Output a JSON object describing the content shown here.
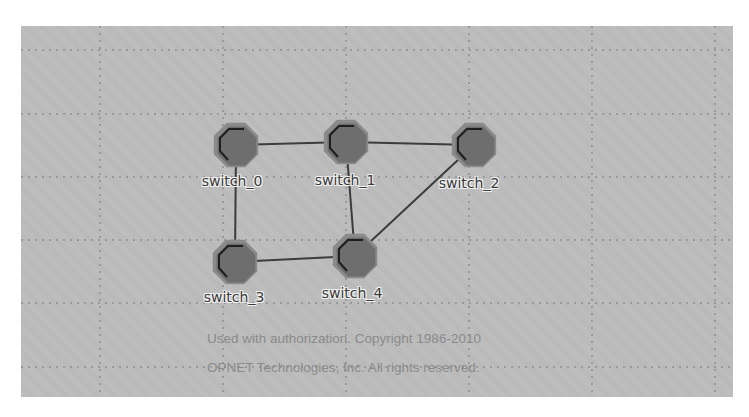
{
  "canvas": {
    "background": "#bdbdbd",
    "grid_color": "#8e8e8e",
    "grid_x": [
      100,
      223,
      346,
      469,
      592,
      715
    ],
    "grid_y": [
      50,
      114,
      177,
      240,
      303,
      367
    ]
  },
  "nodes": [
    {
      "id": "switch_0",
      "label": "switch_0",
      "x": 236,
      "y": 145,
      "label_x": 232,
      "label_y": 175
    },
    {
      "id": "switch_1",
      "label": "switch_1",
      "x": 346,
      "y": 142,
      "label_x": 345,
      "label_y": 174
    },
    {
      "id": "switch_2",
      "label": "switch_2",
      "x": 474,
      "y": 145,
      "label_x": 469,
      "label_y": 177
    },
    {
      "id": "switch_3",
      "label": "switch_3",
      "x": 235,
      "y": 262,
      "label_x": 234,
      "label_y": 291
    },
    {
      "id": "switch_4",
      "label": "switch_4",
      "x": 355,
      "y": 256,
      "label_x": 352,
      "label_y": 287
    }
  ],
  "links": [
    {
      "from": "switch_0",
      "to": "switch_1"
    },
    {
      "from": "switch_1",
      "to": "switch_2"
    },
    {
      "from": "switch_0",
      "to": "switch_3"
    },
    {
      "from": "switch_1",
      "to": "switch_4"
    },
    {
      "from": "switch_2",
      "to": "switch_4"
    },
    {
      "from": "switch_3",
      "to": "switch_4"
    }
  ],
  "node_style": {
    "fill": "#6e6e6e",
    "outline": "#8a8a8a",
    "accent": "#1e1e1e"
  },
  "link_color": "#3c3c3c",
  "copyright": {
    "line1": "Used with authorization. Copyright 1986-2010",
    "line2": "OPNET Technologies, Inc.  All rights reserved."
  }
}
